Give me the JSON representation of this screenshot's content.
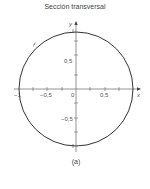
{
  "title": "Sección transversal",
  "caption": "(a)",
  "axes": {
    "x_label": "x",
    "y_label": "y",
    "x_ticks": [
      "−1",
      "−0,5",
      "0",
      "0,5"
    ],
    "y_ticks": [
      "0,5",
      "−0,5"
    ]
  },
  "colors": {
    "stroke": "#333333",
    "axis": "#555555",
    "text": "#444444"
  },
  "shape": {
    "type": "circle",
    "center": [
      0,
      0
    ],
    "radius": 1,
    "orientation_arrows": 4
  }
}
